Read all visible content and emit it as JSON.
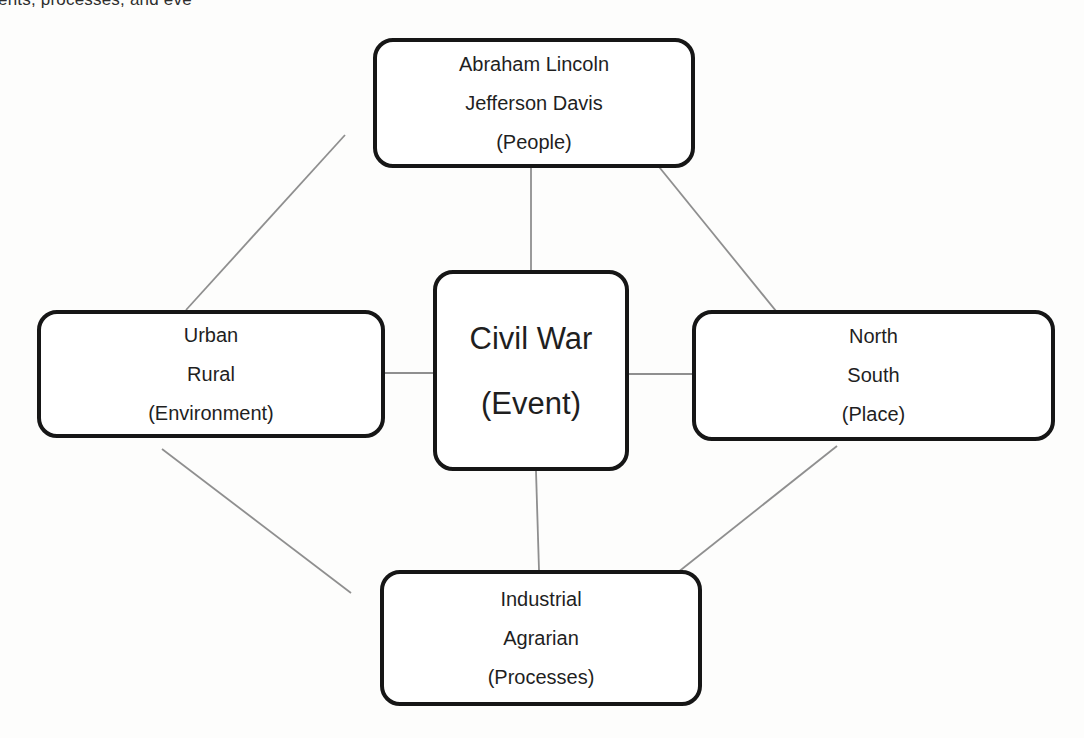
{
  "page": {
    "header_fragment": "ents, processes, and eve"
  },
  "diagram": {
    "title_node": "Civil War (Event)",
    "nodes": {
      "people": {
        "category": "People",
        "lines": [
          "Abraham Lincoln",
          "Jefferson Davis",
          "(People)"
        ]
      },
      "event": {
        "category": "Event",
        "lines": [
          "Civil War",
          "(Event)"
        ]
      },
      "environment": {
        "category": "Environment",
        "lines": [
          "Urban",
          "Rural",
          "(Environment)"
        ]
      },
      "place": {
        "category": "Place",
        "lines": [
          "North",
          "South",
          "(Place)"
        ]
      },
      "processes": {
        "category": "Processes",
        "lines": [
          "Industrial",
          "Agrarian",
          "(Processes)"
        ]
      }
    },
    "connectors": [
      {
        "from": "people",
        "to": "event"
      },
      {
        "from": "environment",
        "to": "event"
      },
      {
        "from": "event",
        "to": "place"
      },
      {
        "from": "event",
        "to": "processes"
      },
      {
        "from": "people",
        "to": "environment"
      },
      {
        "from": "people",
        "to": "place"
      },
      {
        "from": "environment",
        "to": "processes"
      },
      {
        "from": "place",
        "to": "processes"
      }
    ],
    "colors": {
      "box_border": "#161616",
      "box_fill": "#ffffff",
      "connector": "#8f8f8f",
      "text": "#1f1f1f",
      "background": "#fdfdfc"
    }
  }
}
